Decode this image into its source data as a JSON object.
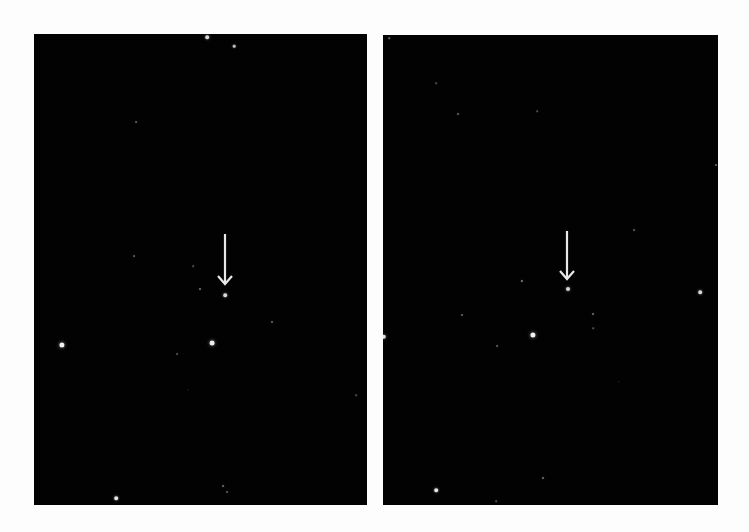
{
  "background": "#fdfdfd",
  "panels": [
    {
      "id": "left",
      "box": {
        "x": 34,
        "y": 34,
        "w": 333,
        "h": 471
      },
      "bg": "#020202",
      "arrow": {
        "x": 225,
        "y_top": 234,
        "y_tip": 284,
        "color": "#e8e8e8"
      },
      "target": {
        "x": 225,
        "y": 295,
        "r": 1.8
      },
      "stars": [
        {
          "x": 207,
          "y": 37,
          "r": 1.8,
          "b": 0.85
        },
        {
          "x": 234,
          "y": 46,
          "r": 1.3,
          "b": 0.75
        },
        {
          "x": 136,
          "y": 122,
          "r": 0.9,
          "b": 0.35
        },
        {
          "x": 134,
          "y": 256,
          "r": 0.9,
          "b": 0.35
        },
        {
          "x": 193,
          "y": 266,
          "r": 0.8,
          "b": 0.3
        },
        {
          "x": 200,
          "y": 289,
          "r": 1.0,
          "b": 0.45
        },
        {
          "x": 62,
          "y": 345,
          "r": 2.6,
          "b": 0.95
        },
        {
          "x": 212,
          "y": 343,
          "r": 2.4,
          "b": 0.92
        },
        {
          "x": 177,
          "y": 354,
          "r": 0.9,
          "b": 0.3
        },
        {
          "x": 272,
          "y": 322,
          "r": 1.0,
          "b": 0.4
        },
        {
          "x": 188,
          "y": 390,
          "r": 0.7,
          "b": 0.25
        },
        {
          "x": 356,
          "y": 395,
          "r": 0.8,
          "b": 0.3
        },
        {
          "x": 116,
          "y": 498,
          "r": 1.8,
          "b": 0.9
        },
        {
          "x": 223,
          "y": 486,
          "r": 0.9,
          "b": 0.4
        },
        {
          "x": 227,
          "y": 492,
          "r": 0.9,
          "b": 0.35
        }
      ]
    },
    {
      "id": "right",
      "box": {
        "x": 383,
        "y": 35,
        "w": 335,
        "h": 470
      },
      "bg": "#020202",
      "arrow": {
        "x": 567,
        "y_top": 231,
        "y_tip": 279,
        "color": "#e8e8e8"
      },
      "target": {
        "x": 568,
        "y": 289,
        "r": 2.0
      },
      "stars": [
        {
          "x": 389,
          "y": 38,
          "r": 0.8,
          "b": 0.4
        },
        {
          "x": 436,
          "y": 83,
          "r": 0.8,
          "b": 0.3
        },
        {
          "x": 458,
          "y": 114,
          "r": 1.0,
          "b": 0.4
        },
        {
          "x": 537,
          "y": 111,
          "r": 0.8,
          "b": 0.3
        },
        {
          "x": 716,
          "y": 165,
          "r": 1.0,
          "b": 0.4
        },
        {
          "x": 634,
          "y": 230,
          "r": 0.9,
          "b": 0.35
        },
        {
          "x": 522,
          "y": 281,
          "r": 1.1,
          "b": 0.5
        },
        {
          "x": 700,
          "y": 292,
          "r": 1.8,
          "b": 0.85
        },
        {
          "x": 462,
          "y": 315,
          "r": 1.0,
          "b": 0.4
        },
        {
          "x": 593,
          "y": 314,
          "r": 1.0,
          "b": 0.45
        },
        {
          "x": 593,
          "y": 328,
          "r": 0.8,
          "b": 0.3
        },
        {
          "x": 533,
          "y": 335,
          "r": 2.6,
          "b": 0.95
        },
        {
          "x": 384,
          "y": 337,
          "r": 2.2,
          "b": 0.9
        },
        {
          "x": 497,
          "y": 346,
          "r": 0.9,
          "b": 0.35
        },
        {
          "x": 619,
          "y": 382,
          "r": 0.7,
          "b": 0.25
        },
        {
          "x": 543,
          "y": 478,
          "r": 1.0,
          "b": 0.45
        },
        {
          "x": 436,
          "y": 490,
          "r": 1.8,
          "b": 0.9
        },
        {
          "x": 496,
          "y": 501,
          "r": 0.8,
          "b": 0.3
        }
      ]
    }
  ]
}
